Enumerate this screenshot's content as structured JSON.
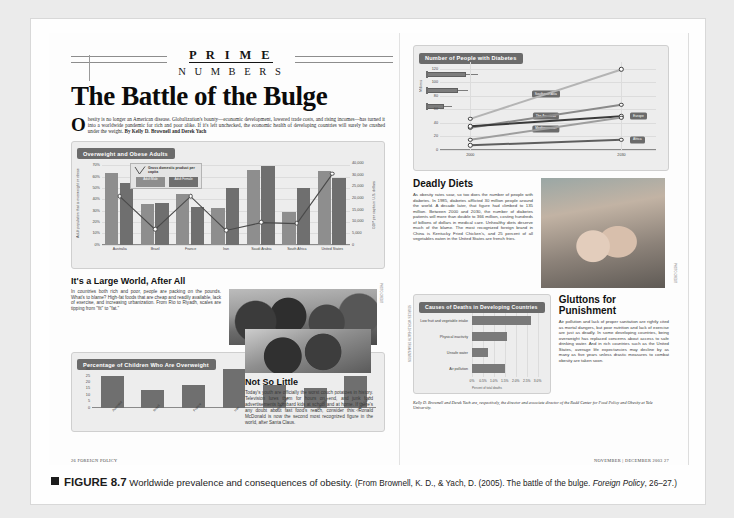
{
  "figure": {
    "label": "FIGURE 8.7",
    "title": "Worldwide prevalence and consequences of obesity.",
    "source": "(From Brownell, K. D., & Yach, D. (2005). The battle of the bulge. ",
    "source_italic": "Foreign Policy",
    "source_tail": ", 26–27.)"
  },
  "left_page": {
    "masthead_line1": "P R I M E",
    "masthead_line2": "N U M B E R S",
    "headline": "The Battle of the Bulge",
    "dropcap": "O",
    "lede": "besity is no longer an American disease. Globalization's bounty—economic development, lowered trade costs, and rising incomes—has turned it into a worldwide pandemic for rich and poor alike. If it's left unchecked, the economic health of developing countries will surely be crushed under the weight.",
    "byline": "By Kelly D. Brownell and Derek Yach",
    "section_heading": "It's a Large World, After All",
    "section_body": "In countries both rich and poor, people are packing on the pounds. What's to blame? High-fat foods that are cheap and readily available, lack of exercise, and increasing urbanization. From Rio to Riyadh, scales are tipping from \"fit\" to \"fat.\"",
    "photo_credit": "PHOTO CREDIT",
    "notso_heading": "Not So Little",
    "notso_body": "Today's youth are officially the worst couch potatoes in history. Television lures them for hours on end, and junk food advertisements bombard kids at school and at home. If there's any doubt about fast food's reach, consider this: Ronald McDonald is now the second most recognized figure in the world, after Santa Claus.",
    "folio": "26  FOREIGN POLICY"
  },
  "right_page": {
    "deadly_heading": "Deadly Diets",
    "deadly_body": "As obesity rates soar, so too does the number of people with diabetes. In 1985, diabetes afflicted 30 million people around the world. A decade later, that figure had climbed to 135 million. Between 2000 and 2030, the number of diabetes patients will more than double to 366 million, costing hundreds of billions of dollars in medical care. Unhealthy diets deserve much of the blame. The most recognized foreign brand in China is Kentucky Fried Chicken's, and 25 percent of all vegetables eaten in the United States are french fries.",
    "glutton_heading": "Gluttons for Punishment",
    "glutton_body": "Air pollution and lack of proper sanitation are rightly cited as mortal dangers, but poor nutrition and lack of exercise are just as deadly. In some developing countries, being overweight has replaced concerns about access to safe drinking water. And in rich countries such as the United States, average life expectancies may decline by as many as five years unless drastic measures to combat obesity are taken soon.",
    "photo_credit": "PHOTO CREDIT",
    "bios": "Kelly D. Brownell and Derek Yach are, respectively, the director and associate director of the Rudd Center for Food Policy and Obesity at Yale University.",
    "folio": "NOVEMBER | DECEMBER 2003  27"
  },
  "chart_data": [
    {
      "id": "overweight-obese-adults",
      "type": "bar",
      "title": "Overweight and Obese Adults",
      "ylabel": "Adult population that is overweight or obese",
      "y2label": "GDP per capita in U.S. dollars",
      "xlabel": "",
      "categories": [
        "Australia",
        "Brazil",
        "France",
        "Iran",
        "Saudi Arabia",
        "South Africa",
        "United States"
      ],
      "yticks": [
        "0%",
        "10%",
        "20%",
        "30%",
        "40%",
        "50%",
        "60%",
        "70%"
      ],
      "ylim": [
        0,
        70
      ],
      "y2ticks": [
        "0",
        "5,000",
        "10,000",
        "15,000",
        "20,000",
        "25,000",
        "30,000",
        "40,000"
      ],
      "y2lim": [
        0,
        40000
      ],
      "series": [
        {
          "name": "Adult Male",
          "color": "#8e8e8e",
          "values": [
            63,
            36,
            45,
            32,
            66,
            29,
            65
          ]
        },
        {
          "name": "Adult Female",
          "color": "#6f6f6f",
          "values": [
            54,
            37,
            33,
            50,
            69,
            50,
            59
          ]
        }
      ],
      "line_series": {
        "name": "Gross domestic product per capita",
        "values": [
          25000,
          8000,
          25000,
          7500,
          11500,
          11000,
          36500
        ]
      },
      "legend_title": "Gross domestic product per capita",
      "legend_position": "inside-top-left",
      "grid": true
    },
    {
      "id": "children-overweight",
      "type": "bar",
      "title": "Percentage of Children Who Are Overweight",
      "ylabel": "",
      "yticks": [
        "0",
        "5",
        "10",
        "15",
        "20",
        "25",
        "30"
      ],
      "ylim": [
        0,
        30
      ],
      "categories": [
        "Australia",
        "Brazil",
        "France",
        "Iran",
        "Saudi Arabia",
        "South Africa",
        "United States"
      ],
      "values": [
        25,
        14,
        18,
        30,
        18,
        15,
        25
      ],
      "color": "#6f6f6f",
      "grid": false
    },
    {
      "id": "people-with-diabetes",
      "type": "line",
      "title": "Number of People with Diabetes",
      "ylabel": "Millions",
      "xlabel": "",
      "x": [
        "2000",
        "2030"
      ],
      "yticks": [
        "0",
        "20",
        "40",
        "60",
        "80",
        "100",
        "120"
      ],
      "ylim": [
        0,
        120
      ],
      "series": [
        {
          "name": "Southeast Asia",
          "color": "#b4b4b4",
          "values": [
            46,
            119
          ]
        },
        {
          "name": "The Americas",
          "color": "#8a8a8a",
          "values": [
            33,
            67
          ]
        },
        {
          "name": "Europe",
          "color": "#3a3a3a",
          "values": [
            35,
            50
          ]
        },
        {
          "name": "Mediterranean",
          "color": "#9e9e9e",
          "values": [
            15,
            48
          ]
        },
        {
          "name": "Africa",
          "color": "#5e5e5e",
          "values": [
            7,
            15
          ]
        }
      ],
      "grid": true,
      "legend_position": "inline-labels"
    },
    {
      "id": "causes-of-deaths",
      "type": "bar",
      "orientation": "horizontal",
      "title": "Causes of Deaths in Developing Countries",
      "categories": [
        "Low fruit and vegetable intake",
        "Physical inactivity",
        "Unsafe water",
        "Air pollution"
      ],
      "values": [
        2.7,
        1.6,
        0.75,
        1.5
      ],
      "xticks": [
        "0%",
        "0.5%",
        "1.0%",
        "1.5%",
        "2.0%",
        "2.5%",
        "3.0%"
      ],
      "xlim": [
        0,
        3
      ],
      "axis_note": "Percent of total deaths",
      "color": "#7a7a7a",
      "source_note": "SOURCES: WORLD HEALTH ORGANIZATION",
      "grid": true
    }
  ]
}
